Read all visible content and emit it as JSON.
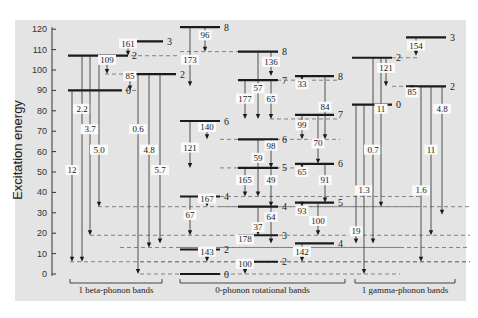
{
  "chart_data": {
    "type": "level-scheme",
    "ylabel": "Excitation energy",
    "yticks": [
      0,
      10,
      20,
      30,
      40,
      50,
      60,
      70,
      80,
      90,
      100,
      110,
      120
    ],
    "ylim": [
      0,
      120
    ],
    "band_groups": [
      "1 beta-phonon bands",
      "0-phonon rotational bands",
      "1 gamma-phonon bands"
    ],
    "levels": [
      {
        "x1": 68,
        "x2": 122,
        "e": 90,
        "spin": "0"
      },
      {
        "x1": 68,
        "x2": 128,
        "e": 107,
        "spin": "2"
      },
      {
        "x1": 125,
        "x2": 163,
        "e": 114,
        "spin": "3"
      },
      {
        "x1": 125,
        "x2": 176,
        "e": 98,
        "spin": "2"
      },
      {
        "x1": 180,
        "x2": 220,
        "e": 0,
        "spin": "0"
      },
      {
        "x1": 180,
        "x2": 220,
        "e": 12,
        "spin": "2"
      },
      {
        "x1": 180,
        "x2": 220,
        "e": 38,
        "spin": "4"
      },
      {
        "x1": 180,
        "x2": 220,
        "e": 75,
        "spin": "6"
      },
      {
        "x1": 180,
        "x2": 220,
        "e": 121,
        "spin": "8"
      },
      {
        "x1": 238,
        "x2": 278,
        "e": 6,
        "spin": "2"
      },
      {
        "x1": 238,
        "x2": 278,
        "e": 19,
        "spin": "3"
      },
      {
        "x1": 238,
        "x2": 278,
        "e": 33,
        "spin": "4"
      },
      {
        "x1": 238,
        "x2": 278,
        "e": 52,
        "spin": "5"
      },
      {
        "x1": 238,
        "x2": 278,
        "e": 66,
        "spin": "6"
      },
      {
        "x1": 238,
        "x2": 278,
        "e": 95,
        "spin": "7"
      },
      {
        "x1": 238,
        "x2": 278,
        "e": 109,
        "spin": "8"
      },
      {
        "x1": 295,
        "x2": 334,
        "e": 15,
        "spin": "4"
      },
      {
        "x1": 295,
        "x2": 334,
        "e": 35,
        "spin": "5"
      },
      {
        "x1": 295,
        "x2": 334,
        "e": 54,
        "spin": "6"
      },
      {
        "x1": 295,
        "x2": 334,
        "e": 78,
        "spin": "7"
      },
      {
        "x1": 295,
        "x2": 334,
        "e": 97,
        "spin": "8"
      },
      {
        "x1": 352,
        "x2": 392,
        "e": 83,
        "spin": "0"
      },
      {
        "x1": 352,
        "x2": 392,
        "e": 106,
        "spin": "2"
      },
      {
        "x1": 406,
        "x2": 446,
        "e": 116,
        "spin": "3"
      },
      {
        "x1": 406,
        "x2": 446,
        "e": 92,
        "spin": "2"
      }
    ],
    "dashes": [
      {
        "x1": 124,
        "x2": 180,
        "e": 107
      },
      {
        "x1": 105,
        "x2": 125,
        "e": 98
      },
      {
        "x1": 125,
        "x2": 138,
        "e": 90
      },
      {
        "x1": 140,
        "x2": 470,
        "e": 6
      },
      {
        "x1": 70,
        "x2": 470,
        "e": 6
      },
      {
        "x1": 120,
        "x2": 470,
        "e": 13
      },
      {
        "x1": 90,
        "x2": 470,
        "e": 19
      },
      {
        "x1": 98,
        "x2": 420,
        "e": 33
      },
      {
        "x1": 140,
        "x2": 400,
        "e": 0
      },
      {
        "x1": 180,
        "x2": 400,
        "e": 13
      },
      {
        "x1": 220,
        "x2": 470,
        "e": 33
      },
      {
        "x1": 220,
        "x2": 420,
        "e": 38
      },
      {
        "x1": 220,
        "x2": 300,
        "e": 52
      },
      {
        "x1": 220,
        "x2": 340,
        "e": 66
      },
      {
        "x1": 270,
        "x2": 340,
        "e": 76
      },
      {
        "x1": 180,
        "x2": 240,
        "e": 109
      },
      {
        "x1": 270,
        "x2": 340,
        "e": 95
      },
      {
        "x1": 392,
        "x2": 420,
        "e": 92
      },
      {
        "x1": 392,
        "x2": 420,
        "e": 106
      }
    ],
    "transitions": [
      {
        "x": 72,
        "from": 90,
        "to": 6,
        "label": "12",
        "ly": 50
      },
      {
        "x": 82,
        "from": 107,
        "to": 6,
        "label": "2.2",
        "ly": 80
      },
      {
        "x": 90,
        "from": 107,
        "to": 19,
        "label": "3.7",
        "ly": 70
      },
      {
        "x": 99,
        "from": 107,
        "to": 33,
        "label": "5.0",
        "ly": 60
      },
      {
        "x": 107,
        "from": 107,
        "to": 98,
        "label": "109",
        "ly": 104
      },
      {
        "x": 128,
        "from": 114,
        "to": 107,
        "label": "161",
        "ly": 112
      },
      {
        "x": 130,
        "from": 98,
        "to": 90,
        "label": "85",
        "ly": 96
      },
      {
        "x": 138,
        "from": 98,
        "to": 0,
        "label": "0.6",
        "ly": 70
      },
      {
        "x": 149,
        "from": 98,
        "to": 13,
        "label": "4.8",
        "ly": 60
      },
      {
        "x": 160,
        "from": 98,
        "to": 15,
        "label": "5.7",
        "ly": 50
      },
      {
        "x": 205,
        "from": 121,
        "to": 109,
        "label": "96",
        "ly": 116
      },
      {
        "x": 190,
        "from": 121,
        "to": 92,
        "label": "173",
        "ly": 104
      },
      {
        "x": 207,
        "from": 75,
        "to": 66,
        "label": "140",
        "ly": 71
      },
      {
        "x": 190,
        "from": 75,
        "to": 52,
        "label": "121",
        "ly": 61
      },
      {
        "x": 207,
        "from": 38,
        "to": 33,
        "label": "167",
        "ly": 36
      },
      {
        "x": 190,
        "from": 38,
        "to": 19,
        "label": "67",
        "ly": 28
      },
      {
        "x": 207,
        "from": 12,
        "to": 6,
        "label": "143",
        "ly": 10
      },
      {
        "x": 271,
        "from": 109,
        "to": 97,
        "label": "136",
        "ly": 103
      },
      {
        "x": 258,
        "from": 109,
        "to": 76,
        "label": "57",
        "ly": 90
      },
      {
        "x": 245,
        "from": 95,
        "to": 76,
        "label": "177",
        "ly": 85
      },
      {
        "x": 271,
        "from": 95,
        "to": 76,
        "label": "65",
        "ly": 85
      },
      {
        "x": 271,
        "from": 66,
        "to": 52,
        "label": "98",
        "ly": 62
      },
      {
        "x": 258,
        "from": 66,
        "to": 38,
        "label": "59",
        "ly": 56
      },
      {
        "x": 245,
        "from": 52,
        "to": 38,
        "label": "165",
        "ly": 45
      },
      {
        "x": 271,
        "from": 52,
        "to": 33,
        "label": "49",
        "ly": 45
      },
      {
        "x": 258,
        "from": 33,
        "to": 19,
        "label": "37",
        "ly": 22
      },
      {
        "x": 271,
        "from": 33,
        "to": 15,
        "label": "64",
        "ly": 27
      },
      {
        "x": 245,
        "from": 19,
        "to": 15,
        "label": "178",
        "ly": 16
      },
      {
        "x": 245,
        "from": 6,
        "to": 0,
        "label": "100",
        "ly": 4
      },
      {
        "x": 302,
        "from": 97,
        "to": 95,
        "label": "33",
        "ly": 92
      },
      {
        "x": 325,
        "from": 97,
        "to": 66,
        "label": "84",
        "ly": 81
      },
      {
        "x": 302,
        "from": 78,
        "to": 66,
        "label": "99",
        "ly": 72
      },
      {
        "x": 318,
        "from": 78,
        "to": 54,
        "label": "70",
        "ly": 63
      },
      {
        "x": 302,
        "from": 54,
        "to": 52,
        "label": "65",
        "ly": 49
      },
      {
        "x": 325,
        "from": 54,
        "to": 35,
        "label": "91",
        "ly": 45
      },
      {
        "x": 302,
        "from": 35,
        "to": 33,
        "label": "93",
        "ly": 30
      },
      {
        "x": 318,
        "from": 35,
        "to": 19,
        "label": "100",
        "ly": 25
      },
      {
        "x": 302,
        "from": 15,
        "to": 6,
        "label": "142",
        "ly": 10
      },
      {
        "x": 356,
        "from": 83,
        "to": 15,
        "label": "19",
        "ly": 20
      },
      {
        "x": 364,
        "from": 83,
        "to": 0,
        "label": "1.3",
        "ly": 40
      },
      {
        "x": 373,
        "from": 106,
        "to": 15,
        "label": "0.7",
        "ly": 60
      },
      {
        "x": 381,
        "from": 106,
        "to": 33,
        "label": "11",
        "ly": 80
      },
      {
        "x": 386,
        "from": 106,
        "to": 92,
        "label": "121",
        "ly": 100
      },
      {
        "x": 416,
        "from": 116,
        "to": 107,
        "label": "154",
        "ly": 111
      },
      {
        "x": 412,
        "from": 92,
        "to": 90,
        "label": "85",
        "ly": 88
      },
      {
        "x": 421,
        "from": 92,
        "to": 6,
        "label": "1.6",
        "ly": 40
      },
      {
        "x": 431,
        "from": 92,
        "to": 19,
        "label": "11",
        "ly": 60
      },
      {
        "x": 442,
        "from": 92,
        "to": 29,
        "label": "4.8",
        "ly": 80
      }
    ]
  },
  "axis": {
    "ylabel": "Excitation energy"
  },
  "bands": {
    "beta": "1 beta-phonon bands",
    "zero": "0-phonon rotational bands",
    "gamma": "1 gamma-phonon bands"
  }
}
